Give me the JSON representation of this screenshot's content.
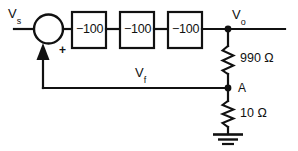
{
  "diagram": {
    "type": "block-diagram-circuit",
    "background_color": "#ffffff",
    "line_color": "#111111"
  },
  "signals": {
    "source_label": "V",
    "source_sub": "s",
    "output_label": "V",
    "output_sub": "o",
    "feedback_label": "V",
    "feedback_sub": "f"
  },
  "summer": {
    "name": "summing-junction",
    "plus_sign": "+"
  },
  "blocks": [
    {
      "id": "stage-1",
      "gain": "−100"
    },
    {
      "id": "stage-2",
      "gain": "−100"
    },
    {
      "id": "stage-3",
      "gain": "−100"
    }
  ],
  "nodes": [
    {
      "id": "node-vo",
      "label": ""
    },
    {
      "id": "node-a",
      "label": "A"
    }
  ],
  "resistors": [
    {
      "id": "r-990",
      "value": "990",
      "unit": "Ω",
      "label": "990 Ω"
    },
    {
      "id": "r-10",
      "value": "10",
      "unit": "Ω",
      "label": "10 Ω"
    }
  ],
  "ground": {
    "name": "ground-symbol",
    "bars": 3
  }
}
